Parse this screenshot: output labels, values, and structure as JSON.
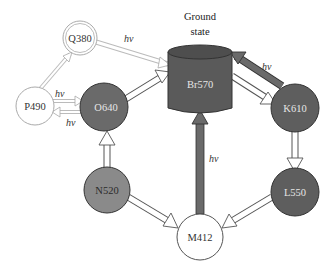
{
  "title": {
    "line1": "Ground",
    "line2": "state"
  },
  "states": [
    {
      "id": "Br570",
      "label": "Br570",
      "shape": "cylinder",
      "fill": "#5a5a5a",
      "text_color": "#e6e6e6"
    },
    {
      "id": "K610",
      "label": "K610",
      "shape": "circle",
      "fill": "#5e5e5e",
      "text_color": "#e6e6e6"
    },
    {
      "id": "L550",
      "label": "L550",
      "shape": "circle",
      "fill": "#5e5e5e",
      "text_color": "#e6e6e6"
    },
    {
      "id": "M412",
      "label": "M412",
      "shape": "circle",
      "fill": "#ffffff",
      "text_color": "#333333"
    },
    {
      "id": "N520",
      "label": "N520",
      "shape": "circle",
      "fill": "#8a8a8a",
      "text_color": "#2a2a2a"
    },
    {
      "id": "O640",
      "label": "O640",
      "shape": "circle",
      "fill": "#6a6a6a",
      "text_color": "#e6e6e6"
    },
    {
      "id": "P490",
      "label": "P490",
      "shape": "circle",
      "fill": "#ffffff",
      "text_color": "#333333"
    },
    {
      "id": "Q380",
      "label": "Q380",
      "shape": "double-circle",
      "fill": "#ffffff",
      "text_color": "#333333"
    }
  ],
  "transitions": [
    {
      "from": "Br570",
      "to": "K610",
      "label": "hv",
      "style": "dark"
    },
    {
      "from": "K610",
      "to": "Br570",
      "label": "",
      "style": "white"
    },
    {
      "from": "K610",
      "to": "L550",
      "label": "",
      "style": "white"
    },
    {
      "from": "L550",
      "to": "M412",
      "label": "",
      "style": "white"
    },
    {
      "from": "M412",
      "to": "Br570",
      "label": "hv",
      "style": "dark"
    },
    {
      "from": "M412",
      "to": "N520",
      "label": "",
      "style": "white"
    },
    {
      "from": "N520",
      "to": "O640",
      "label": "",
      "style": "white"
    },
    {
      "from": "O640",
      "to": "Br570",
      "label": "",
      "style": "white"
    },
    {
      "from": "O640",
      "to": "P490",
      "label": "hv",
      "style": "light"
    },
    {
      "from": "P490",
      "to": "O640",
      "label": "hv",
      "style": "light"
    },
    {
      "from": "P490",
      "to": "Q380",
      "label": "",
      "style": "light"
    },
    {
      "from": "Q380",
      "to": "Br570",
      "label": "hv",
      "style": "light"
    }
  ],
  "hv_labels": {
    "br_k": "hv",
    "m_br": "hv",
    "p_o_top": "hv",
    "o_p_bottom": "hv",
    "q_br": "hv"
  }
}
